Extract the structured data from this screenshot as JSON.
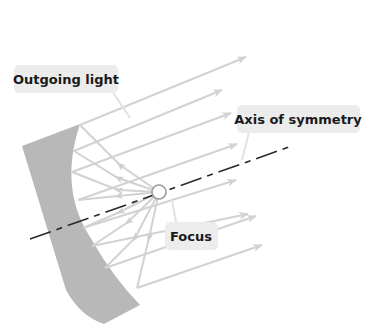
{
  "diagram": {
    "type": "concave-mirror-ray-diagram",
    "labels": {
      "outgoing_light": "Outgoing light",
      "axis_of_symmetry": "Axis of symmetry",
      "focus": "Focus"
    },
    "colors": {
      "background": "#ffffff",
      "mirror": "#b8b8b8",
      "rays": "#d2d2d2",
      "axis": "#2a2a2a",
      "label_bubble": "#ececec",
      "label_text": "#1a1a1a",
      "focus_circle": "#9a9a9a"
    },
    "focus_point": {
      "x": 159,
      "y": 192
    }
  }
}
